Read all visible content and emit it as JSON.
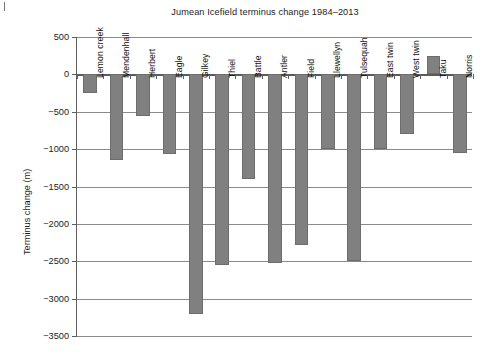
{
  "chart_data": {
    "type": "bar",
    "title": "Jumean Icefield terminus change 1984–2013",
    "xlabel": "",
    "ylabel": "Terminus change (m)",
    "ylim": [
      -3500,
      500
    ],
    "ytick_step": 500,
    "yticks": [
      500,
      0,
      -500,
      -1000,
      -1500,
      -2000,
      -2500,
      -3000,
      -3500
    ],
    "ytick_labels": [
      "500",
      "0",
      "−500",
      "−1000",
      "−1500",
      "−2000",
      "−2500",
      "−3000",
      "−3500"
    ],
    "grid": true,
    "legend": false,
    "bar_color": "#808080",
    "categories": [
      "Lemon creek",
      "Mendenhall",
      "Herbert",
      "Eagle",
      "Gilkey",
      "Thiel",
      "Battle",
      "Antler",
      "Field",
      "Llewellyn",
      "Tulsequah",
      "East twin",
      "West twin",
      "Taku",
      "Norris"
    ],
    "values": [
      -250,
      -1150,
      -560,
      -1070,
      -3200,
      -2550,
      -1400,
      -2530,
      -2280,
      -1000,
      -2500,
      -1000,
      -800,
      250,
      -1050
    ]
  }
}
